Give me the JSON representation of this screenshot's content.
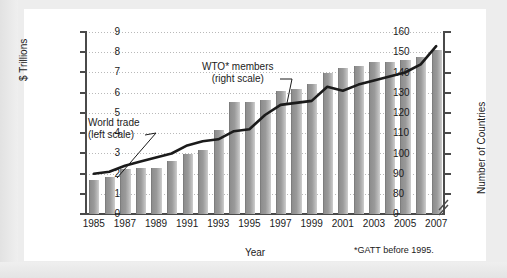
{
  "chart_data": {
    "type": "bar",
    "title": "",
    "xlabel": "Year",
    "ylabel": "$ Trillions",
    "y2label": "Number of Countries",
    "categories": [
      1985,
      1986,
      1987,
      1988,
      1989,
      1990,
      1991,
      1992,
      1993,
      1994,
      1995,
      1996,
      1997,
      1998,
      1999,
      2000,
      2001,
      2002,
      2003,
      2004,
      2005,
      2006,
      2007
    ],
    "tick_labels_x": [
      "1985",
      "1987",
      "1989",
      "1991",
      "1993",
      "1995",
      "1997",
      "1999",
      "2001",
      "2003",
      "2005",
      "2007"
    ],
    "ylim": [
      0,
      9
    ],
    "yticks": [
      "0",
      "1",
      "2",
      "3",
      "4",
      "5",
      "6",
      "7",
      "8",
      "9"
    ],
    "y2lim_display": [
      0,
      160
    ],
    "y2ticks": [
      "0",
      "80",
      "90",
      "100",
      "110",
      "120",
      "130",
      "140",
      "150",
      "160"
    ],
    "y2_axis_break": true,
    "grid": "horizontal-dotted",
    "legend_position": "inline-annotations",
    "series": [
      {
        "name": "World trade (left scale)",
        "type": "bar",
        "axis": "left",
        "unit": "$ Trillions",
        "values": [
          1.7,
          1.83,
          2.22,
          2.3,
          2.3,
          2.62,
          2.95,
          3.17,
          4.15,
          5.55,
          5.55,
          5.65,
          6.1,
          6.18,
          6.43,
          6.95,
          7.22,
          7.3,
          7.5,
          7.5,
          7.6,
          7.78,
          8.1
        ]
      },
      {
        "name": "WTO* members (right scale)",
        "type": "line",
        "axis": "right",
        "unit": "Number of Countries",
        "values": [
          90,
          91,
          94,
          96,
          98,
          100,
          104,
          106,
          107,
          111,
          112,
          119,
          124,
          125,
          126,
          133,
          131,
          134,
          136,
          138,
          140,
          144,
          153
        ]
      }
    ],
    "annotations": [
      {
        "text_line1": "World trade",
        "text_line2": "(left scale)",
        "points_to": "bar-series"
      },
      {
        "text_line1": "WTO* members",
        "text_line2": "(right scale)",
        "points_to": "line-series"
      }
    ],
    "footnote": "*GATT before 1995.",
    "colors": {
      "bar": "#9a9a9a",
      "line": "#1b1b1b",
      "grid": "#b9b9b9",
      "axis": "#4a4a4a",
      "panel": "#ffffff",
      "page": "#ededed"
    }
  }
}
